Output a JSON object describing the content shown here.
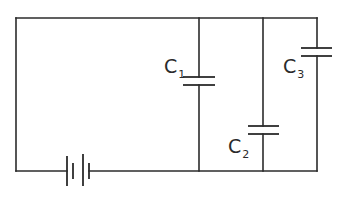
{
  "diagram": {
    "type": "circuit",
    "components": [
      {
        "id": "battery",
        "kind": "battery",
        "label": ""
      },
      {
        "id": "c1",
        "kind": "capacitor",
        "label": "C",
        "subscript": "1"
      },
      {
        "id": "c2",
        "kind": "capacitor",
        "label": "C",
        "subscript": "2"
      },
      {
        "id": "c3",
        "kind": "capacitor",
        "label": "C",
        "subscript": "3"
      }
    ],
    "colors": {
      "line": "#2b2b2b",
      "background": "#ffffff"
    }
  }
}
